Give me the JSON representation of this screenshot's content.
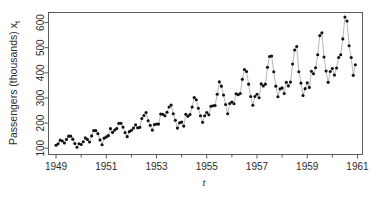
{
  "chart_data": {
    "type": "line",
    "title": "",
    "subtitle": "",
    "xlabel": "t",
    "ylabel": "Passengers (thousands) x",
    "ylabel_subscript": "t",
    "xlim": [
      1948.7,
      1961.2
    ],
    "ylim": [
      75,
      640
    ],
    "grid": false,
    "legend": null,
    "legend_position": "none",
    "marker": "filled-circle",
    "line_style": "thin-solid-connector",
    "xticks": [
      1949,
      1951,
      1953,
      1955,
      1957,
      1959,
      1961
    ],
    "xtick_labels": [
      "1949",
      "1951",
      "1953",
      "1955",
      "1957",
      "1959",
      "1961"
    ],
    "xminor_ticks": [
      1950,
      1952,
      1954,
      1956,
      1958,
      1960
    ],
    "yticks": [
      100,
      200,
      300,
      400,
      500,
      600
    ],
    "ytick_labels": [
      "100",
      "200",
      "300",
      "400",
      "500",
      "600"
    ],
    "series": [
      {
        "name": "AirPassengers",
        "x": [
          1949.0,
          1949.083,
          1949.167,
          1949.25,
          1949.333,
          1949.417,
          1949.5,
          1949.583,
          1949.667,
          1949.75,
          1949.833,
          1949.917,
          1950.0,
          1950.083,
          1950.167,
          1950.25,
          1950.333,
          1950.417,
          1950.5,
          1950.583,
          1950.667,
          1950.75,
          1950.833,
          1950.917,
          1951.0,
          1951.083,
          1951.167,
          1951.25,
          1951.333,
          1951.417,
          1951.5,
          1951.583,
          1951.667,
          1951.75,
          1951.833,
          1951.917,
          1952.0,
          1952.083,
          1952.167,
          1952.25,
          1952.333,
          1952.417,
          1952.5,
          1952.583,
          1952.667,
          1952.75,
          1952.833,
          1952.917,
          1953.0,
          1953.083,
          1953.167,
          1953.25,
          1953.333,
          1953.417,
          1953.5,
          1953.583,
          1953.667,
          1953.75,
          1953.833,
          1953.917,
          1954.0,
          1954.083,
          1954.167,
          1954.25,
          1954.333,
          1954.417,
          1954.5,
          1954.583,
          1954.667,
          1954.75,
          1954.833,
          1954.917,
          1955.0,
          1955.083,
          1955.167,
          1955.25,
          1955.333,
          1955.417,
          1955.5,
          1955.583,
          1955.667,
          1955.75,
          1955.833,
          1955.917,
          1956.0,
          1956.083,
          1956.167,
          1956.25,
          1956.333,
          1956.417,
          1956.5,
          1956.583,
          1956.667,
          1956.75,
          1956.833,
          1956.917,
          1957.0,
          1957.083,
          1957.167,
          1957.25,
          1957.333,
          1957.417,
          1957.5,
          1957.583,
          1957.667,
          1957.75,
          1957.833,
          1957.917,
          1958.0,
          1958.083,
          1958.167,
          1958.25,
          1958.333,
          1958.417,
          1958.5,
          1958.583,
          1958.667,
          1958.75,
          1958.833,
          1958.917,
          1959.0,
          1959.083,
          1959.167,
          1959.25,
          1959.333,
          1959.417,
          1959.5,
          1959.583,
          1959.667,
          1959.75,
          1959.833,
          1959.917,
          1960.0,
          1960.083,
          1960.167,
          1960.25,
          1960.333,
          1960.417,
          1960.5,
          1960.583,
          1960.667,
          1960.75,
          1960.833,
          1960.917
        ],
        "values": [
          112,
          118,
          132,
          129,
          121,
          135,
          148,
          148,
          136,
          119,
          104,
          118,
          115,
          126,
          141,
          135,
          125,
          149,
          170,
          170,
          158,
          133,
          114,
          140,
          145,
          150,
          178,
          163,
          172,
          178,
          199,
          199,
          184,
          162,
          146,
          166,
          171,
          180,
          193,
          181,
          183,
          218,
          230,
          242,
          209,
          191,
          172,
          194,
          196,
          196,
          236,
          235,
          229,
          243,
          264,
          272,
          237,
          211,
          180,
          201,
          204,
          188,
          235,
          227,
          234,
          264,
          302,
          293,
          259,
          229,
          203,
          229,
          242,
          233,
          267,
          269,
          270,
          315,
          364,
          347,
          312,
          274,
          237,
          278,
          284,
          277,
          317,
          313,
          318,
          374,
          413,
          405,
          355,
          306,
          271,
          306,
          315,
          301,
          356,
          348,
          355,
          422,
          465,
          467,
          404,
          347,
          305,
          336,
          340,
          318,
          362,
          348,
          363,
          435,
          491,
          505,
          404,
          359,
          310,
          337,
          360,
          342,
          406,
          396,
          420,
          472,
          548,
          559,
          463,
          407,
          362,
          405,
          417,
          391,
          419,
          461,
          472,
          535,
          622,
          606,
          508,
          461,
          390,
          432
        ]
      }
    ]
  },
  "axes": {
    "x_axis_label": "t",
    "y_axis_label": "Passengers (thousands) x",
    "y_axis_label_sub": "t"
  },
  "colors": {
    "background": "#ffffff",
    "frame": "#4a4a4a",
    "dot": "#111111",
    "connector": "#7a7a7a",
    "text": "#2b2b2b"
  }
}
